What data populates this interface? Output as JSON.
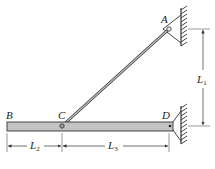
{
  "figure": {
    "type": "structural-mechanics-diagram",
    "colors": {
      "bar_fill": "#c4c4c4",
      "line": "#333333",
      "background": "#ffffff"
    },
    "points": {
      "A": {
        "label": "A"
      },
      "B": {
        "label": "B"
      },
      "C": {
        "label": "C"
      },
      "D": {
        "label": "D"
      }
    },
    "dimensions": {
      "L1": {
        "letter": "L",
        "sub": "1"
      },
      "L2": {
        "letter": "L",
        "sub": "2"
      },
      "L3": {
        "letter": "L",
        "sub": "3"
      }
    }
  }
}
